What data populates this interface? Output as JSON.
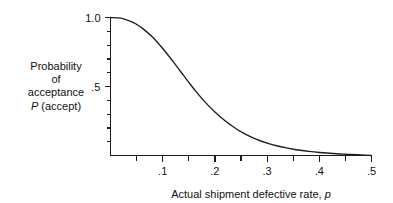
{
  "figure": {
    "background_color": "#ffffff",
    "line_color": "#1d1d1d"
  },
  "y_axis_label": {
    "line1": "Probability",
    "line2": "of",
    "line3": "acceptance",
    "line4_italic": "P",
    "line4_rest": " (accept)"
  },
  "x_axis_label": {
    "text": "Actual shipment defective rate, ",
    "italic_symbol": "p"
  },
  "y_ticks": {
    "label_top": "1.0",
    "label_mid": ".5"
  },
  "x_ticks": {
    "t1": ".1",
    "t2": ".2",
    "t3": ".3",
    "t4": ".4",
    "t5": ".5"
  },
  "chart_data": {
    "type": "line",
    "title": "",
    "subtitle": "",
    "xlabel": "Actual shipment defective rate, p",
    "ylabel": "Probability of acceptance P (accept)",
    "xlim": [
      0.0,
      0.5
    ],
    "ylim": [
      0.0,
      1.0
    ],
    "grid": false,
    "legend": null,
    "x_tick_labels": [
      ".1",
      ".2",
      ".3",
      ".4",
      ".5"
    ],
    "x_tick_values": [
      0.1,
      0.2,
      0.3,
      0.4,
      0.5
    ],
    "x_minor_tick_values": [
      0.05,
      0.15,
      0.25,
      0.35,
      0.45
    ],
    "y_tick_labels": [
      "1.0",
      ".5"
    ],
    "y_tick_values": [
      1.0,
      0.5
    ],
    "y_minor_tick_values": [
      0.1,
      0.2,
      0.3,
      0.4,
      0.6,
      0.7,
      0.8,
      0.9
    ],
    "series": [
      {
        "name": "Operating characteristic curve",
        "x": [
          0.0,
          0.02,
          0.04,
          0.05,
          0.06,
          0.08,
          0.1,
          0.12,
          0.14,
          0.15,
          0.16,
          0.18,
          0.2,
          0.22,
          0.24,
          0.25,
          0.26,
          0.28,
          0.3,
          0.32,
          0.34,
          0.35,
          0.36,
          0.38,
          0.4,
          0.42,
          0.44,
          0.45,
          0.46,
          0.48,
          0.5
        ],
        "y": [
          1.0,
          0.995,
          0.97,
          0.95,
          0.925,
          0.86,
          0.775,
          0.68,
          0.58,
          0.53,
          0.482,
          0.392,
          0.315,
          0.25,
          0.196,
          0.172,
          0.152,
          0.117,
          0.09,
          0.069,
          0.053,
          0.046,
          0.04,
          0.03,
          0.022,
          0.016,
          0.011,
          0.009,
          0.007,
          0.004,
          0.0
        ]
      }
    ]
  }
}
